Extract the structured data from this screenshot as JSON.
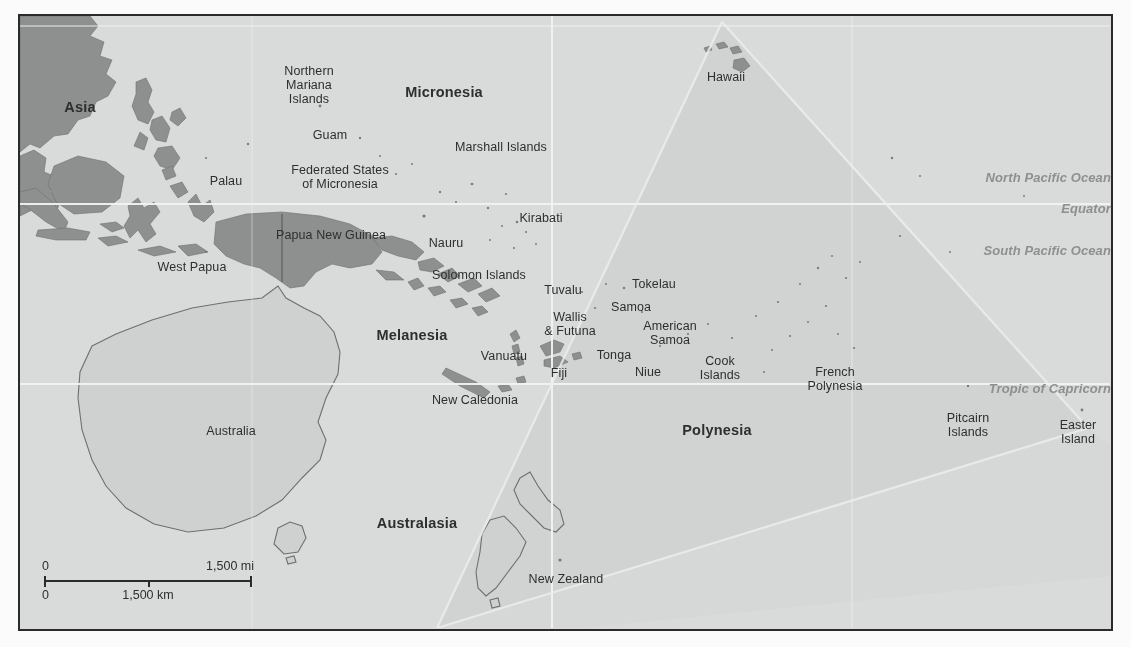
{
  "figure": {
    "frame_border_color": "#2b2b2b",
    "ocean_color": "#d9dbda",
    "land_dark_color": "#8e908f",
    "land_light_color": "#cfd1d0",
    "polynesia_shade_color": "#cdcfce",
    "graticule_color": "#f2f3f2",
    "label_color": "#2e2e2e",
    "ocean_label_color": "#8d8f91"
  },
  "regions": [
    {
      "name": "Asia",
      "label": "Asia",
      "x": 60,
      "y": 83
    },
    {
      "name": "Micronesia",
      "label": "Micronesia",
      "x": 424,
      "y": 68
    },
    {
      "name": "Melanesia",
      "label": "Melanesia",
      "x": 392,
      "y": 311
    },
    {
      "name": "Polynesia",
      "label": "Polynesia",
      "x": 697,
      "y": 406
    },
    {
      "name": "Australasia",
      "label": "Australasia",
      "x": 397,
      "y": 499
    }
  ],
  "countries": [
    {
      "name": "northern-mariana-islands",
      "label": "Northern\nMariana\nIslands",
      "x": 289,
      "y": 48,
      "align": "center"
    },
    {
      "name": "guam",
      "label": "Guam",
      "x": 310,
      "y": 112,
      "align": "center"
    },
    {
      "name": "palau",
      "label": "Palau",
      "x": 206,
      "y": 158,
      "align": "center"
    },
    {
      "name": "federated-states-of-micronesia",
      "label": "Federated States\nof Micronesia",
      "x": 320,
      "y": 147,
      "align": "center"
    },
    {
      "name": "marshall-islands",
      "label": "Marshall Islands",
      "x": 481,
      "y": 124,
      "align": "center"
    },
    {
      "name": "hawaii",
      "label": "Hawaii",
      "x": 706,
      "y": 54,
      "align": "center"
    },
    {
      "name": "kirabati",
      "label": "Kirabati",
      "x": 521,
      "y": 195,
      "align": "center"
    },
    {
      "name": "nauru",
      "label": "Nauru",
      "x": 426,
      "y": 220,
      "align": "center"
    },
    {
      "name": "papua-new-guinea",
      "label": "Papua New Guinea",
      "x": 311,
      "y": 212,
      "align": "center"
    },
    {
      "name": "west-papua",
      "label": "West Papua",
      "x": 172,
      "y": 244,
      "align": "center"
    },
    {
      "name": "solomon-islands",
      "label": "Solomon Islands",
      "x": 459,
      "y": 252,
      "align": "center"
    },
    {
      "name": "tuvalu",
      "label": "Tuvalu",
      "x": 543,
      "y": 267,
      "align": "center"
    },
    {
      "name": "tokelau",
      "label": "Tokelau",
      "x": 634,
      "y": 261,
      "align": "center"
    },
    {
      "name": "samoa",
      "label": "Samoa",
      "x": 611,
      "y": 284,
      "align": "center"
    },
    {
      "name": "wallis-and-futuna",
      "label": "Wallis\n& Futuna",
      "x": 550,
      "y": 294,
      "align": "center"
    },
    {
      "name": "american-samoa",
      "label": "American\nSamoa",
      "x": 650,
      "y": 303,
      "align": "center"
    },
    {
      "name": "vanuatu",
      "label": "Vanuatu",
      "x": 484,
      "y": 333,
      "align": "center"
    },
    {
      "name": "fiji",
      "label": "Fiji",
      "x": 539,
      "y": 350,
      "align": "center"
    },
    {
      "name": "tonga",
      "label": "Tonga",
      "x": 594,
      "y": 332,
      "align": "center"
    },
    {
      "name": "niue",
      "label": "Niue",
      "x": 628,
      "y": 349,
      "align": "center"
    },
    {
      "name": "cook-islands",
      "label": "Cook\nIslands",
      "x": 700,
      "y": 338,
      "align": "center"
    },
    {
      "name": "french-polynesia",
      "label": "French\nPolynesia",
      "x": 815,
      "y": 349,
      "align": "center"
    },
    {
      "name": "new-caledonia",
      "label": "New Caledonia",
      "x": 455,
      "y": 377,
      "align": "center"
    },
    {
      "name": "australia",
      "label": "Australia",
      "x": 211,
      "y": 408,
      "align": "center"
    },
    {
      "name": "new-zealand",
      "label": "New Zealand",
      "x": 546,
      "y": 556,
      "align": "center"
    },
    {
      "name": "pitcairn-islands",
      "label": "Pitcairn\nIslands",
      "x": 948,
      "y": 395,
      "align": "center"
    },
    {
      "name": "easter-island",
      "label": "Easter\nIsland",
      "x": 1058,
      "y": 402,
      "align": "center"
    }
  ],
  "ocean_labels": [
    {
      "name": "north-pacific-ocean",
      "label": "North Pacific Ocean",
      "x": 1091,
      "y": 155
    },
    {
      "name": "equator",
      "label": "Equator",
      "x": 1091,
      "y": 186
    },
    {
      "name": "south-pacific-ocean",
      "label": "South Pacific Ocean",
      "x": 1091,
      "y": 228
    },
    {
      "name": "tropic-of-capricorn",
      "label": "Tropic of Capricorn",
      "x": 1091,
      "y": 366
    }
  ],
  "scale_bar": {
    "miles_start": "0",
    "miles_end": "1,500 mi",
    "km_start": "0",
    "km_end": "1,500 km"
  }
}
